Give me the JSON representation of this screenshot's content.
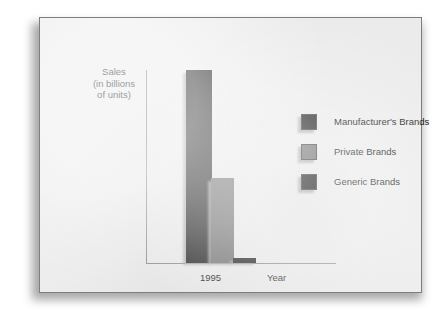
{
  "chart_data": {
    "type": "bar",
    "title": "",
    "subtitle": "",
    "categories": [
      "1995"
    ],
    "xlabel": "Year",
    "ylabel": "Sales (in billions of units)",
    "ylabel_lines": [
      "Sales",
      "(in billions",
      "of units)"
    ],
    "xtick_labels": [
      "1995"
    ],
    "ytick_labels": [],
    "ylim": [
      0,
      100
    ],
    "grid": false,
    "legend_position": "right",
    "series": [
      {
        "name": "Manufacturer's Brands",
        "values": [
          100
        ],
        "color": "#1d1d1d"
      },
      {
        "name": "Private Brands",
        "values": [
          44
        ],
        "color": "#6e6e6e"
      },
      {
        "name": "Generic Brands",
        "values": [
          2.5
        ],
        "color": "#1d1d1d"
      }
    ],
    "annotations": []
  },
  "axes": {
    "y_label_lines": [
      "Sales",
      "(in billions",
      "of units)"
    ],
    "x_tick": "1995",
    "x_label": "Year"
  },
  "legend": {
    "items": [
      {
        "label": "Manufacturer's Brands",
        "color": "#1d1d1d"
      },
      {
        "label": "Private Brands",
        "color": "#6e6e6e"
      },
      {
        "label": "Generic Brands",
        "color": "#1d1d1d"
      }
    ]
  },
  "colors": {
    "panel_background": "#ebebeb",
    "panel_border": "#7d7d7d",
    "axis": "#8a8a8a",
    "dark_bar": "#1d1d1d",
    "gray_bar": "#6e6e6e",
    "text": "#1c1c1c",
    "page_background": "#ffffff"
  }
}
